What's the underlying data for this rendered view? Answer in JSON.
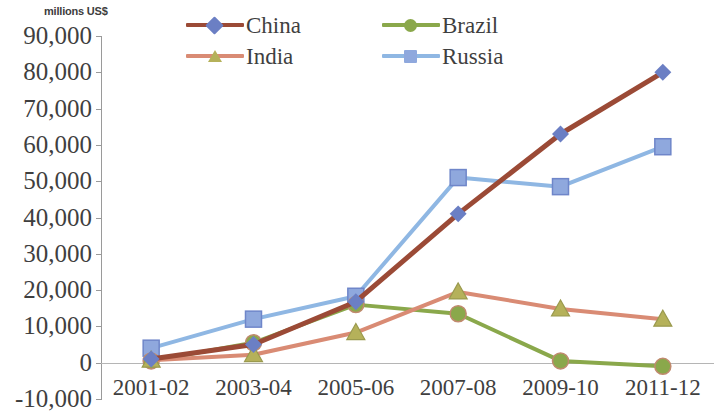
{
  "chart_data": {
    "type": "line",
    "title": "",
    "subtitle": "",
    "unit_label": "millions US$",
    "xlabel": "",
    "ylabel": "",
    "categories": [
      "2001-02",
      "2003-04",
      "2005-06",
      "2007-08",
      "2009-10",
      "2011-12"
    ],
    "ylim": [
      -10000,
      90000
    ],
    "ytick_labels": [
      "90,000",
      "80,000",
      "70,000",
      "60,000",
      "50,000",
      "40,000",
      "30,000",
      "20,000",
      "10,000",
      "0",
      "-10,000"
    ],
    "ytick_values": [
      90000,
      80000,
      70000,
      60000,
      50000,
      40000,
      30000,
      20000,
      10000,
      0,
      -10000
    ],
    "grid": false,
    "zero_line": true,
    "legend_position": "top",
    "series": [
      {
        "name": "China",
        "color": "#9b4a36",
        "marker": "diamond",
        "marker_color": "#6b7fc4",
        "values": [
          1000,
          5000,
          16800,
          41000,
          63000,
          80000
        ]
      },
      {
        "name": "Brazil",
        "color": "#8aa84b",
        "marker": "circle",
        "marker_color": "#8aa84b",
        "values": [
          500,
          5500,
          16000,
          13500,
          500,
          -1000
        ]
      },
      {
        "name": "India",
        "color": "#d98b74",
        "marker": "triangle",
        "marker_color": "#b5b15a",
        "values": [
          700,
          2200,
          8300,
          19500,
          14800,
          12000
        ]
      },
      {
        "name": "Russia",
        "color": "#8fb7e3",
        "marker": "square",
        "marker_color": "#8fa8dd",
        "values": [
          4000,
          12000,
          18300,
          51000,
          48500,
          59500
        ]
      }
    ]
  },
  "legend": {
    "entries": [
      {
        "label": "China"
      },
      {
        "label": "Brazil"
      },
      {
        "label": "India"
      },
      {
        "label": "Russia"
      }
    ]
  },
  "colors": {
    "axis": "#9a9a9a",
    "text": "#3f3f3f",
    "background": "#ffffff"
  }
}
